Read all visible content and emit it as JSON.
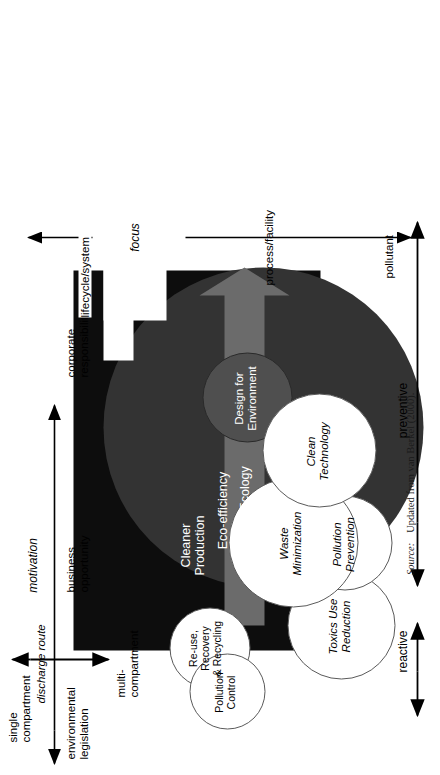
{
  "figure": {
    "source_label": "Source:",
    "source_text": "Updated from van Berkel (2000)."
  },
  "colors": {
    "black_box": "#0d0d0d",
    "dark_circle": "#333333",
    "mid_circle": "#4f4f4f",
    "grey_arrow": "#6b6b6b",
    "white_circle": "#ffffff",
    "outline": "#5a5a5a",
    "page": "#ffffff"
  },
  "axes": {
    "motivation": {
      "name": "motivation",
      "left_label": "environmental\nlegislation",
      "mid_label": "business\nopportunity",
      "right_label": "corporate\nresponsibility",
      "style": "double-headed"
    },
    "preventive": {
      "name": "preventive",
      "style": "double-headed"
    },
    "reactive": {
      "name": "reactive",
      "style": "double-headed"
    },
    "discharge_route": {
      "name": "discharge route",
      "left_label": "single\ncompartment",
      "right_label": "multi-\ncompartment",
      "style": "double-headed"
    },
    "focus": {
      "name": "focus",
      "top_label": "lifecycle/system",
      "mid_label": "process/facility",
      "bottom_label": "pollutant",
      "style": "double-headed"
    }
  },
  "shapes": {
    "black_box_label": "Cleaner\nProduction",
    "dark_circle_label": "Eco-efficiency",
    "mid_circle_label": "Design for\nEnvironment",
    "grey_arrow_label": "Industrial Ecology"
  },
  "concept_circles": [
    {
      "id": "toxics-use-reduction",
      "label": "Toxics Use\nReduction"
    },
    {
      "id": "pollution-prevention",
      "label": "Pollution\nPrevention"
    },
    {
      "id": "waste-minimization",
      "label": "Waste\nMinimization"
    },
    {
      "id": "clean-technology",
      "label": "Clean\nTechnology"
    },
    {
      "id": "reuse-recovery-recycling",
      "label": "Re-use,\nRecovery\n& Recycling"
    },
    {
      "id": "pollution-control",
      "label": "Pollution\nControl"
    }
  ]
}
